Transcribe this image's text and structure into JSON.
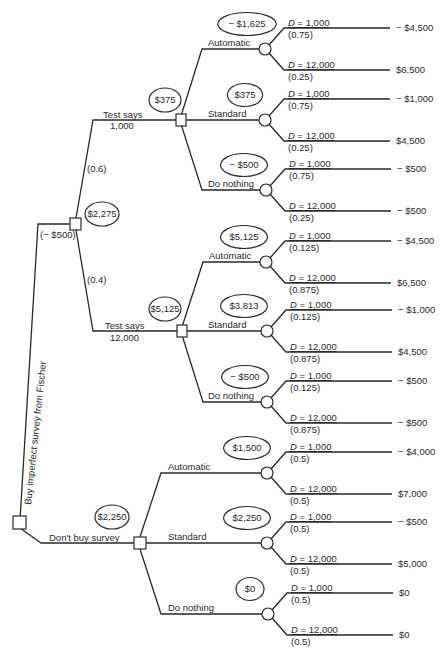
{
  "root": {
    "label": "Buy imperfect survey from Fischer",
    "cost": "(− $500)"
  },
  "survey": {
    "ev": "$2,275",
    "branches": [
      {
        "label_line1": "Test says",
        "label_line2": "1,000",
        "prob": "(0.6)",
        "ev": "$375",
        "options": [
          {
            "label": "Automatic",
            "ev": "− $1,625",
            "outcomes": [
              {
                "d": "D = 1,000",
                "p": "(0.75)",
                "payoff": "− $4,500"
              },
              {
                "d": "D = 12,000",
                "p": "(0.25)",
                "payoff": "$6,500"
              }
            ]
          },
          {
            "label": "Standard",
            "ev": "$375",
            "outcomes": [
              {
                "d": "D = 1,000",
                "p": "(0.75)",
                "payoff": "− $1,000"
              },
              {
                "d": "D = 12,000",
                "p": "(0.25)",
                "payoff": "$4,500"
              }
            ]
          },
          {
            "label": "Do nothing",
            "ev": "− $500",
            "outcomes": [
              {
                "d": "D = 1,000",
                "p": "(0.75)",
                "payoff": "− $500"
              },
              {
                "d": "D = 12,000",
                "p": "(0.25)",
                "payoff": "− $500"
              }
            ]
          }
        ]
      },
      {
        "label_line1": "Test says",
        "label_line2": "12,000",
        "prob": "(0.4)",
        "ev": "$5,125",
        "options": [
          {
            "label": "Automatic",
            "ev": "$5,125",
            "outcomes": [
              {
                "d": "D = 1,000",
                "p": "(0.125)",
                "payoff": "− $4,500"
              },
              {
                "d": "D = 12,000",
                "p": "(0.875)",
                "payoff": "$6,500"
              }
            ]
          },
          {
            "label": "Standard",
            "ev": "$3,813",
            "outcomes": [
              {
                "d": "D = 1,000",
                "p": "(0.125)",
                "payoff": "− $1,000"
              },
              {
                "d": "D = 12,000",
                "p": "(0.875)",
                "payoff": "$4,500"
              }
            ]
          },
          {
            "label": "Do nothing",
            "ev": "− $500",
            "outcomes": [
              {
                "d": "D = 1,000",
                "p": "(0.125)",
                "payoff": "− $500"
              },
              {
                "d": "D = 12,000",
                "p": "(0.875)",
                "payoff": "− $500"
              }
            ]
          }
        ]
      }
    ]
  },
  "no_survey": {
    "label": "Don't buy survey",
    "ev": "$2,250",
    "options": [
      {
        "label": "Automatic",
        "ev": "$1,500",
        "outcomes": [
          {
            "d": "D = 1,000",
            "p": "(0.5)",
            "payoff": "− $4,000"
          },
          {
            "d": "D = 12,000",
            "p": "(0.5)",
            "payoff": "$7,000"
          }
        ]
      },
      {
        "label": "Standard",
        "ev": "$2,250",
        "outcomes": [
          {
            "d": "D = 1,000",
            "p": "(0.5)",
            "payoff": "− $500"
          },
          {
            "d": "D = 12,000",
            "p": "(0.5)",
            "payoff": "$5,000"
          }
        ]
      },
      {
        "label": "Do nothing",
        "ev": "$0",
        "outcomes": [
          {
            "d": "D = 1,000",
            "p": "(0.5)",
            "payoff": "$0"
          },
          {
            "d": "D = 12,000",
            "p": "(0.5)",
            "payoff": "$0"
          }
        ]
      }
    ]
  },
  "colors": {
    "ink": "#2a2a2a",
    "background": "#ffffff"
  }
}
